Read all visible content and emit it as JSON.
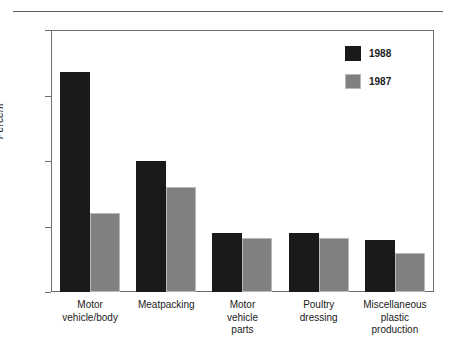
{
  "chart_data": {
    "type": "bar",
    "title": "",
    "subtitle": "",
    "xlabel": "",
    "ylabel": "Percent",
    "ylim": [
      0,
      20
    ],
    "yticks": [
      0,
      5,
      10,
      15,
      20
    ],
    "ytick_labels": [
      "0",
      "5",
      "10",
      "15",
      "20"
    ],
    "grid": false,
    "legend_position": "top-right",
    "categories": [
      "Motor\nvehicle/body",
      "Meatpacking",
      "Motor\nvehicle\nparts",
      "Poultry\ndressing",
      "Miscellaneous\nplastic\nproduction"
    ],
    "series": [
      {
        "name": "1988",
        "color": "#1a1a1a",
        "values": [
          16.8,
          10.0,
          4.5,
          4.5,
          4.0
        ]
      },
      {
        "name": "1987",
        "color": "#808080",
        "values": [
          6.0,
          8.0,
          4.1,
          4.1,
          3.0
        ]
      }
    ]
  },
  "legend": {
    "entries": [
      {
        "label": "1988",
        "swatch": "black-swatch"
      },
      {
        "label": "1987",
        "swatch": "gray-swatch"
      }
    ]
  },
  "colors": {
    "series_1988": "#1a1a1a",
    "series_1987": "#808080",
    "axis": "#6e6e6e",
    "rule": "#5a5a5a",
    "text": "#1a1a1a",
    "background": "#ffffff"
  }
}
